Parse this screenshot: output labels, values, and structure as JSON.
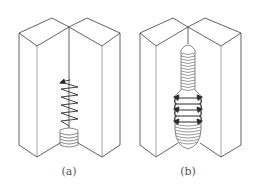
{
  "figure": {
    "panels": [
      {
        "id": "a",
        "label": "(a)",
        "description": "Groove weld with short root bead and upward zig-zag weave arrows"
      },
      {
        "id": "b",
        "label": "(b)",
        "description": "Groove weld filled with layered beads and side-to-side weave arrows"
      }
    ],
    "colors": {
      "line": "#3a3a3a",
      "thin": "#8a8a8a",
      "bg": "#ffffff"
    }
  }
}
